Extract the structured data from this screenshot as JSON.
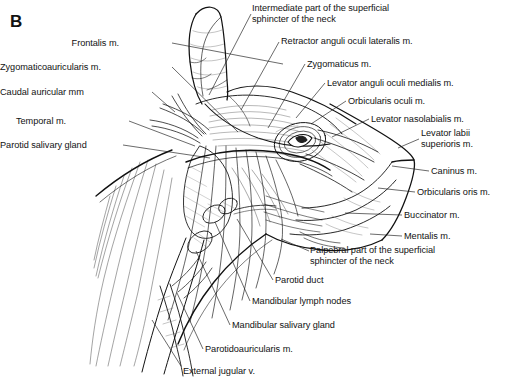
{
  "figure": {
    "panel_letter": "B",
    "style": "black-and-white line drawing with hatched shading and leader lines"
  },
  "labels": {
    "left": [
      {
        "id": "frontalis",
        "text": "Frontalis m.",
        "x": 119,
        "y": 38,
        "align": "right",
        "leader": [
          [
            172,
            43
          ],
          [
            283,
            64
          ]
        ]
      },
      {
        "id": "zygomaticoauricularis",
        "text": "Zygomaticoauricularis m.",
        "x": 43,
        "y": 62,
        "align": "right",
        "leader": [
          [
            172,
            67
          ],
          [
            238,
            132
          ]
        ]
      },
      {
        "id": "caudal-auricular",
        "text": "Caudal auricular mm",
        "x": 48,
        "y": 87,
        "align": "right",
        "leader": [
          [
            152,
            92
          ],
          [
            175,
            112
          ]
        ]
      },
      {
        "id": "temporal",
        "text": "Temporal m.",
        "x": 66,
        "y": 116,
        "align": "right",
        "leader": [
          [
            129,
            121
          ],
          [
            195,
            146
          ]
        ]
      },
      {
        "id": "parotid-salivary-gland",
        "text": "Parotid salivary gland",
        "x": 11,
        "y": 140,
        "align": "right",
        "leader": [
          [
            123,
            145
          ],
          [
            210,
            158
          ]
        ]
      }
    ],
    "top": [
      {
        "id": "intermediate-sphincter",
        "text": "Intermediate part of the superficial\nsphincter of the neck",
        "x": 252,
        "y": 3,
        "align": "left",
        "leader": [
          [
            251,
            14
          ],
          [
            209,
            95
          ]
        ]
      },
      {
        "id": "retractor-anguli-oculi",
        "text": "Retractor anguli oculi lateralis m.",
        "x": 281,
        "y": 36,
        "align": "left",
        "leader": [
          [
            279,
            42
          ],
          [
            241,
            110
          ]
        ]
      },
      {
        "id": "zygomaticus",
        "text": "Zygomaticus m.",
        "x": 307,
        "y": 59,
        "align": "left",
        "leader": [
          [
            305,
            64
          ],
          [
            268,
            128
          ]
        ]
      },
      {
        "id": "levator-anguli-oculi",
        "text": "Levator anguli oculi medialis m.",
        "x": 327,
        "y": 78,
        "align": "left",
        "leader": [
          [
            325,
            83
          ],
          [
            296,
            118
          ]
        ]
      },
      {
        "id": "orbicularis-oculi",
        "text": "Orbicularis oculi m.",
        "x": 348,
        "y": 96,
        "align": "left",
        "leader": [
          [
            346,
            101
          ],
          [
            311,
            124
          ]
        ]
      },
      {
        "id": "levator-nasolabialis",
        "text": "Levator nasolabialis m.",
        "x": 371,
        "y": 114,
        "align": "left",
        "leader": [
          [
            369,
            119
          ],
          [
            332,
            137
          ]
        ]
      }
    ],
    "right": [
      {
        "id": "levator-labii-superioris",
        "text": "Levator labii\nsuperioris m.",
        "x": 421,
        "y": 128,
        "align": "left",
        "leader": [
          [
            419,
            139
          ],
          [
            398,
            148
          ]
        ]
      },
      {
        "id": "caninus",
        "text": "Caninus m.",
        "x": 431,
        "y": 166,
        "align": "left",
        "leader": [
          [
            429,
            171
          ],
          [
            392,
            166
          ]
        ]
      },
      {
        "id": "orbicularis-oris",
        "text": "Orbicularis oris m.",
        "x": 417,
        "y": 187,
        "align": "left",
        "leader": [
          [
            415,
            192
          ],
          [
            378,
            188
          ]
        ]
      },
      {
        "id": "buccinator",
        "text": "Buccinator m.",
        "x": 404,
        "y": 210,
        "align": "left",
        "leader": [
          [
            402,
            215
          ],
          [
            345,
            213
          ]
        ]
      },
      {
        "id": "mentalis",
        "text": "Mentalis m.",
        "x": 404,
        "y": 231,
        "align": "left",
        "leader": [
          [
            402,
            236
          ],
          [
            370,
            234
          ]
        ]
      }
    ],
    "bottom": [
      {
        "id": "palpebral-sphincter",
        "text": "Palpebral part of the superficial\nsphincter of the neck",
        "x": 310,
        "y": 245,
        "align": "left",
        "leader": [
          [
            309,
            251
          ],
          [
            281,
            239
          ]
        ]
      },
      {
        "id": "parotid-duct",
        "text": "Parotid duct",
        "x": 275,
        "y": 275,
        "align": "left",
        "leader": [
          [
            273,
            280
          ],
          [
            237,
            219
          ]
        ]
      },
      {
        "id": "mandibular-lymph-nodes",
        "text": "Mandibular lymph nodes",
        "x": 252,
        "y": 296,
        "align": "left",
        "leader": [
          [
            250,
            301
          ],
          [
            215,
            222
          ]
        ]
      },
      {
        "id": "mandibular-salivary-gland",
        "text": "Mandibular salivary gland",
        "x": 232,
        "y": 320,
        "align": "left",
        "leader": [
          [
            230,
            325
          ],
          [
            196,
            251
          ]
        ]
      },
      {
        "id": "parotidoauricularis",
        "text": "Parotidoauricularis m.",
        "x": 205,
        "y": 344,
        "align": "left",
        "leader": [
          [
            203,
            349
          ],
          [
            177,
            293
          ]
        ]
      },
      {
        "id": "external-jugular",
        "text": "External jugular v.",
        "x": 183,
        "y": 366,
        "align": "left",
        "leader": [
          [
            181,
            366
          ],
          [
            152,
            320
          ]
        ]
      }
    ]
  },
  "colors": {
    "ink": "#111111",
    "background": "#ffffff",
    "leader": "#1a1a1a",
    "hatch": "#555555"
  }
}
